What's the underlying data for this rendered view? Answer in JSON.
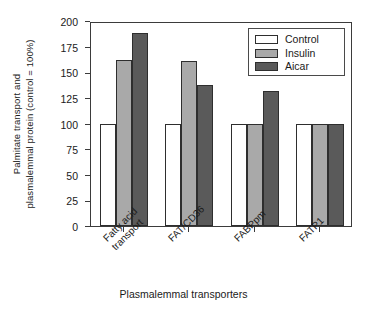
{
  "chart_data": {
    "type": "bar",
    "title": "",
    "xlabel": "Plasmalemmal transporters",
    "ylabel": "Palmitate transport and plasmalemmal protein (control = 100%)",
    "ylabel_line1": "Palmitate transport and",
    "ylabel_line2": "plasmalemmal protein (control = 100%)",
    "categories": [
      "Fatty acid transport",
      "FAT/CD36",
      "FABPpm",
      "FATP1"
    ],
    "category_lines": [
      [
        "Fatty acid",
        "transport"
      ],
      [
        "FAT/CD36"
      ],
      [
        "FABPpm"
      ],
      [
        "FATP1"
      ]
    ],
    "series": [
      {
        "name": "Control",
        "values": [
          100,
          100,
          100,
          100
        ],
        "color": "#ffffff"
      },
      {
        "name": "Insulin",
        "values": [
          162,
          161,
          100,
          100
        ],
        "color": "#a9a9a9"
      },
      {
        "name": "Aicar",
        "values": [
          188,
          138,
          132,
          100
        ],
        "color": "#5a5a5a"
      }
    ],
    "ylim": [
      0,
      200
    ],
    "yticks": [
      0,
      25,
      50,
      75,
      100,
      125,
      150,
      175,
      200
    ],
    "ytick_labels": [
      "0",
      "25",
      "50",
      "75",
      "100",
      "125",
      "150",
      "175",
      "200"
    ],
    "grid": false,
    "legend_position": "top-right",
    "legend_entries": [
      "Control",
      "Insulin",
      "Aicar"
    ]
  },
  "legend": {
    "items": [
      {
        "label": "Control",
        "color": "#ffffff"
      },
      {
        "label": "Insulin",
        "color": "#a9a9a9"
      },
      {
        "label": "Aicar",
        "color": "#5a5a5a"
      }
    ]
  },
  "axes": {
    "y_title_line1": "Palmitate transport and",
    "y_title_line2": "plasmalemmal protein (control = 100%)",
    "x_title": "Plasmalemmal transporters",
    "y_ticks": [
      "200",
      "175",
      "150",
      "125",
      "100",
      "75",
      "50",
      "25",
      "0"
    ],
    "x_categories": [
      {
        "line1": "Fatty acid",
        "line2": "transport"
      },
      {
        "line1": "FAT/CD36",
        "line2": ""
      },
      {
        "line1": "FABPpm",
        "line2": ""
      },
      {
        "line1": "FATP1",
        "line2": ""
      }
    ]
  },
  "colors": {
    "control": "#ffffff",
    "insulin": "#a9a9a9",
    "aicar": "#5a5a5a",
    "axis": "#3b3b3b",
    "text": "#1a1a1a",
    "background": "#ffffff"
  }
}
